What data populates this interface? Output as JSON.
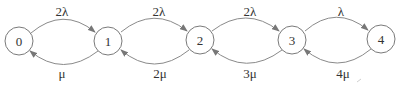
{
  "diagram": {
    "type": "state-transition",
    "nodes": [
      {
        "id": "0",
        "label": "0",
        "cx": 19,
        "cy": 41
      },
      {
        "id": "1",
        "label": "1",
        "cx": 108,
        "cy": 41
      },
      {
        "id": "2",
        "label": "2",
        "cx": 200,
        "cy": 40
      },
      {
        "id": "3",
        "label": "3",
        "cx": 292,
        "cy": 40
      },
      {
        "id": "4",
        "label": "4",
        "cx": 381,
        "cy": 39
      }
    ],
    "forward_edges": [
      {
        "from": "0",
        "to": "1",
        "label": "2λ"
      },
      {
        "from": "1",
        "to": "2",
        "label": "2λ"
      },
      {
        "from": "2",
        "to": "3",
        "label": "2λ"
      },
      {
        "from": "3",
        "to": "4",
        "label": "λ"
      }
    ],
    "backward_edges": [
      {
        "from": "1",
        "to": "0",
        "label": "μ"
      },
      {
        "from": "2",
        "to": "1",
        "label": "2μ"
      },
      {
        "from": "3",
        "to": "2",
        "label": "3μ"
      },
      {
        "from": "4",
        "to": "3",
        "label": "4μ"
      }
    ]
  }
}
